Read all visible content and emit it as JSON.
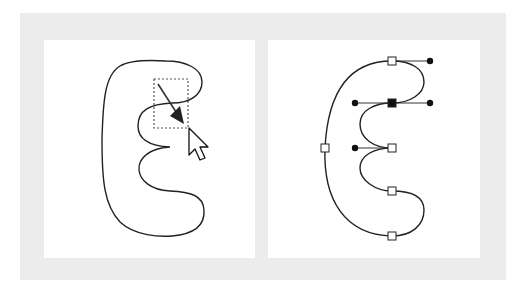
{
  "figure": {
    "colors": {
      "frame": "#ececec",
      "panel": "#ffffff",
      "stroke": "#222222",
      "selection_box": "#555555"
    },
    "panels": [
      {
        "id": "left",
        "content": "Closed curved shape with dotted marquee selection box and drag arrow, mouse pointer cursor",
        "icons": [
          "arrow-pointer-icon",
          "drag-arrow-icon"
        ]
      },
      {
        "id": "right",
        "content": "Same shape showing anchor points (squares) and control handles (dots)",
        "anchor_points": 7,
        "selected_anchor_points": 1,
        "handle_points": 5
      }
    ]
  }
}
